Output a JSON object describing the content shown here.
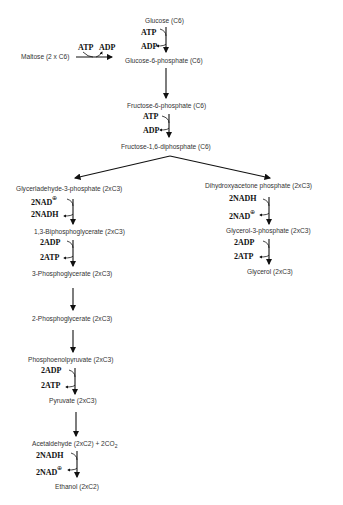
{
  "nodes": {
    "glucose": "Glucose (C6)",
    "maltose": "Maltose (2 x C6)",
    "g6p": "Glucose-6-phosphate (C6)",
    "f6p": "Fructose-6-phosphate (C6)",
    "f16dp": "Fructose-1,6-diphosphate (C6)",
    "gap": "Glycerladehyde-3-phosphate (2xC3)",
    "dhap": "Dihydroxyacetone phosphate (2xC3)",
    "bpg13": "1,3-Biphosphoglycerate  (2xC3)",
    "pg3": "3-Phosphoglycerate  (2xC3)",
    "pg2": "2-Phosphoglycerate  (2xC3)",
    "pep": "Phosphoenolpyruvate  (2xC3)",
    "pyruvate": "Pyruvate  (2xC3)",
    "acetaldehyde": "Acetaldehyde (2xC2) + 2CO",
    "acetaldehyde_sub": "2",
    "ethanol": "Ethanol (2xC2)",
    "g3p": "Glycerol-3-phosphate (2xC3)",
    "glycerol": "Glycerol (2xC3)"
  },
  "cofactors": {
    "atp": "ATP",
    "adp": "ADP",
    "nad": "2NAD",
    "nadh": "2NADH",
    "adp2": "2ADP",
    "atp2": "2ATP",
    "plus": "⊕"
  }
}
